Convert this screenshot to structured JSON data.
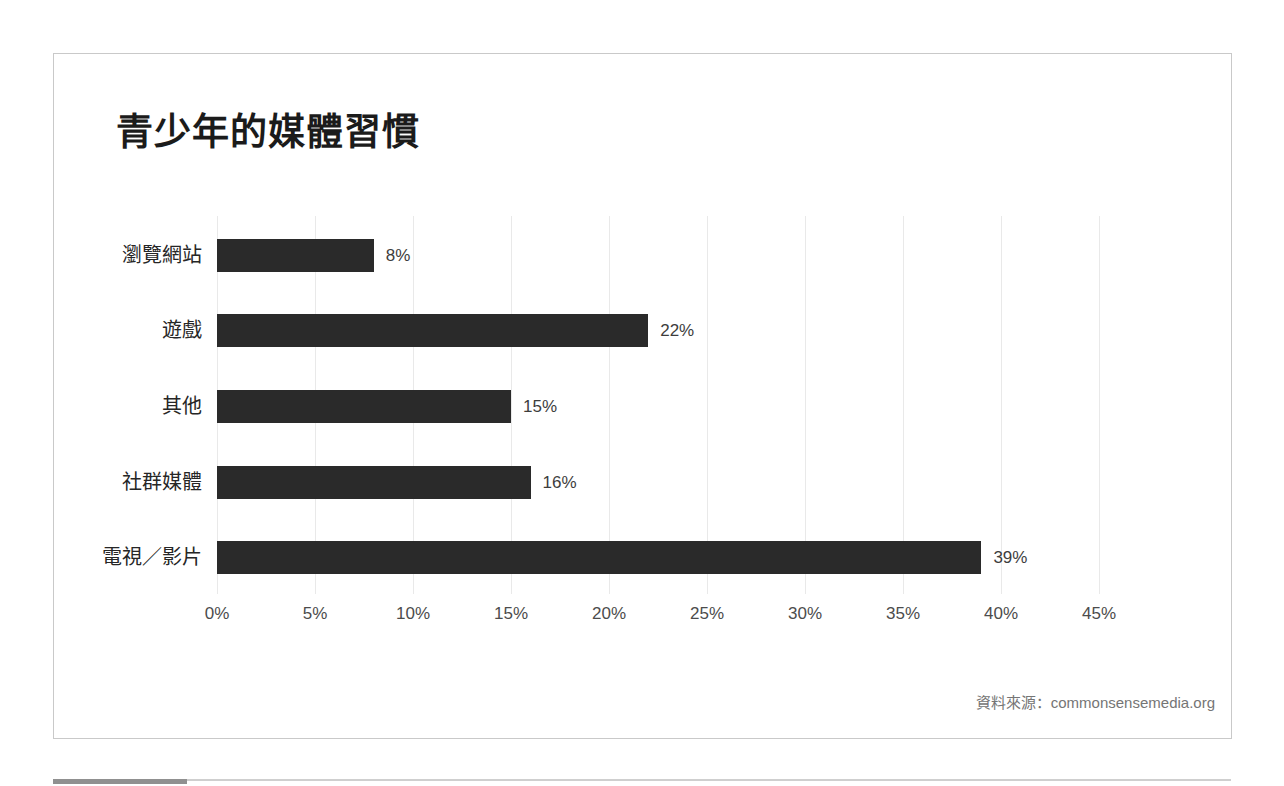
{
  "window": {
    "background": "#ffffff"
  },
  "card": {
    "background": "#ffffff",
    "border_color": "#c9c9c9"
  },
  "chart_data": {
    "type": "bar",
    "orientation": "horizontal",
    "title": "青少年的媒體習慣",
    "categories": [
      "瀏覽網站",
      "遊戲",
      "其他",
      "社群媒體",
      "電視／影片"
    ],
    "values": [
      8,
      22,
      15,
      16,
      39
    ],
    "value_labels": [
      "8%",
      "22%",
      "15%",
      "16%",
      "39%"
    ],
    "x_tick_labels": [
      "0%",
      "5%",
      "10%",
      "15%",
      "20%",
      "25%",
      "30%",
      "35%",
      "40%",
      "45%"
    ],
    "x_tick_values": [
      0,
      5,
      10,
      15,
      20,
      25,
      30,
      35,
      40,
      45
    ],
    "xlim": [
      0,
      50
    ],
    "xlabel": "",
    "ylabel": "",
    "bar_color": "#2a2a2a",
    "gridlines": true,
    "legend": false,
    "source": "資料來源：commonsensemedia.org"
  }
}
